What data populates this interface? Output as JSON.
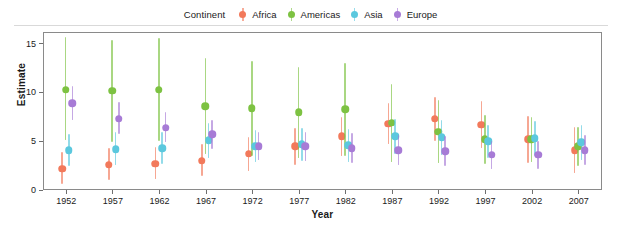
{
  "legend": {
    "title": "Continent",
    "entries": [
      {
        "label": "Africa",
        "color": "#F2795B"
      },
      {
        "label": "Americas",
        "color": "#7DC242"
      },
      {
        "label": "Asia",
        "color": "#5BC8DE"
      },
      {
        "label": "Europe",
        "color": "#A77BD6"
      }
    ]
  },
  "chart_data": {
    "type": "scatter",
    "title": "",
    "subtitle": "",
    "xlabel": "Year",
    "ylabel": "Estimate",
    "xlim": [
      1949.5,
      2009.5
    ],
    "ylim": [
      0,
      16.2
    ],
    "yticks": [
      0,
      5,
      10,
      15
    ],
    "ytick_labels": [
      "0",
      "5",
      "10",
      "15"
    ],
    "grid": false,
    "legend_position": "top",
    "legend_title": "Continent",
    "error_bars": "vertical confidence intervals",
    "categories": [
      1952,
      1957,
      1962,
      1967,
      1972,
      1977,
      1982,
      1987,
      1992,
      1997,
      2002,
      2007
    ],
    "xtick_labels": [
      "1952",
      "1957",
      "1962",
      "1967",
      "1972",
      "1977",
      "1982",
      "1987",
      "1992",
      "1997",
      "2002",
      "2007"
    ],
    "series": [
      {
        "name": "Africa",
        "color": "#F2795B",
        "values": [
          2.3,
          2.7,
          2.8,
          3.1,
          3.8,
          4.6,
          5.6,
          6.9,
          7.4,
          6.8,
          5.3,
          4.2
        ],
        "ci_low": [
          0.7,
          1.1,
          1.2,
          1.5,
          2.1,
          2.7,
          3.6,
          4.8,
          5.1,
          4.4,
          2.9,
          1.8
        ],
        "ci_high": [
          4.0,
          4.4,
          4.5,
          4.8,
          5.5,
          6.5,
          7.6,
          9.0,
          9.6,
          9.2,
          7.7,
          6.6
        ]
      },
      {
        "name": "Americas",
        "color": "#7DC242",
        "values": [
          10.4,
          10.3,
          10.4,
          8.7,
          8.5,
          8.1,
          8.4,
          7.0,
          6.1,
          5.3,
          5.3,
          4.6
        ],
        "ci_low": [
          5.2,
          5.0,
          5.1,
          3.8,
          3.6,
          3.4,
          3.6,
          3.0,
          2.9,
          2.8,
          3.0,
          2.6
        ],
        "ci_high": [
          15.8,
          15.5,
          15.7,
          13.6,
          13.3,
          12.7,
          13.1,
          11.0,
          9.3,
          7.8,
          7.6,
          6.6
        ]
      },
      {
        "name": "Asia",
        "color": "#5BC8DE",
        "values": [
          4.2,
          4.3,
          4.4,
          5.2,
          4.6,
          4.8,
          4.7,
          5.6,
          5.5,
          5.1,
          5.4,
          5.0
        ],
        "ci_low": [
          2.6,
          2.7,
          2.8,
          3.4,
          3.0,
          3.1,
          3.0,
          3.8,
          3.7,
          3.4,
          3.6,
          3.2
        ],
        "ci_high": [
          5.8,
          6.0,
          6.1,
          7.0,
          6.3,
          6.5,
          6.4,
          7.4,
          7.3,
          6.8,
          7.2,
          6.8
        ]
      },
      {
        "name": "Europe",
        "color": "#A77BD6",
        "values": [
          9.0,
          7.4,
          6.5,
          5.8,
          4.6,
          4.6,
          4.4,
          4.2,
          4.1,
          3.7,
          3.7,
          4.2
        ],
        "ci_low": [
          7.3,
          5.8,
          5.0,
          4.3,
          3.2,
          3.1,
          2.9,
          2.7,
          2.6,
          2.3,
          2.3,
          2.7
        ],
        "ci_high": [
          10.8,
          9.1,
          8.1,
          7.3,
          6.1,
          6.1,
          5.9,
          5.7,
          5.6,
          5.1,
          5.1,
          5.7
        ]
      }
    ]
  }
}
